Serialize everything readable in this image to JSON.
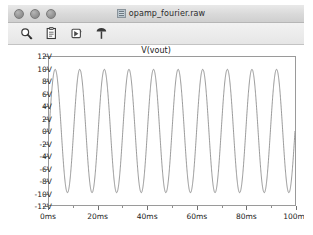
{
  "window": {
    "title": "opamp_fourier.raw",
    "doc_icon": "raw-file-icon",
    "controls": [
      {
        "name": "close-button",
        "label": ""
      },
      {
        "name": "minimize-button",
        "label": ""
      },
      {
        "name": "zoom-button",
        "label": ""
      }
    ]
  },
  "toolbar": {
    "buttons": [
      {
        "name": "zoom-tool-icon",
        "tooltip": "Zoom"
      },
      {
        "name": "copy-bitmap-icon",
        "tooltip": "Copy bitmap to clipboard"
      },
      {
        "name": "cursor-tool-icon",
        "tooltip": "Cursor"
      },
      {
        "name": "pin-tool-icon",
        "tooltip": "Pin"
      }
    ]
  },
  "chart_data": {
    "type": "line",
    "title": "V(vout)",
    "xlabel": "",
    "ylabel": "",
    "grid": false,
    "legend": null,
    "xlim": [
      0,
      100
    ],
    "ylim": [
      -12,
      12
    ],
    "x_unit": "ms",
    "y_unit": "V",
    "x_ticks": [
      0,
      20,
      40,
      60,
      80,
      100
    ],
    "x_tick_labels": [
      "0ms",
      "20ms",
      "40ms",
      "60ms",
      "80ms",
      "100ms"
    ],
    "y_ticks": [
      12,
      10,
      8,
      6,
      4,
      2,
      0,
      -2,
      -4,
      -6,
      -8,
      -10,
      -12
    ],
    "y_tick_labels": [
      "12V",
      "10V",
      "8V",
      "6V",
      "4V",
      "2V",
      "0V",
      "-2V",
      "-4V",
      "-6V",
      "-8V",
      "-10V",
      "-12V"
    ],
    "series": [
      {
        "name": "V(vout)",
        "color": "#6b6b6b",
        "waveform": "sine",
        "amplitude": 10,
        "offset": 0,
        "cycles": 10,
        "frequency_hz": 100,
        "phase_deg": 0
      }
    ]
  }
}
